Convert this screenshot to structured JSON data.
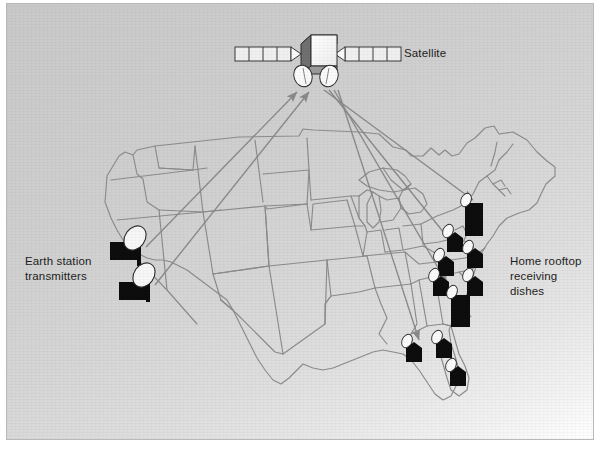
{
  "figure": {
    "background_color": "#d2d2d2",
    "border_color": "#b9b9b9",
    "line_color": "#8c8c8c",
    "building_color": "#0d0d0d",
    "dish_color": "#f4f4f4",
    "arrow_color": "#8a8a8a"
  },
  "labels": {
    "satellite": "Satellite",
    "earth_station": "Earth station\ntransmitters",
    "home_dishes": "Home rooftop\nreceiving dishes"
  },
  "satellite": {
    "name": "satellite",
    "body": {
      "x": 294,
      "y": 33,
      "w": 34,
      "h": 32
    },
    "panel_left": {
      "x": 228,
      "y": 43,
      "w": 56,
      "h": 14,
      "cells": 4
    },
    "panel_right": {
      "x": 338,
      "y": 43,
      "w": 56,
      "h": 14,
      "cells": 4
    },
    "antennas": [
      {
        "cx": 296,
        "cy": 72
      },
      {
        "cx": 322,
        "cy": 72
      }
    ]
  },
  "earth_stations": [
    {
      "id": "earth-station-1",
      "x": 103,
      "y": 238,
      "dish_cx": 128,
      "dish_cy": 236
    },
    {
      "id": "earth-station-2",
      "x": 115,
      "y": 278,
      "dish_cx": 137,
      "dish_cy": 272
    }
  ],
  "home_dishes": [
    {
      "id": "home-dish-1",
      "x": 462,
      "y": 202,
      "tall": true
    },
    {
      "id": "home-dish-2",
      "x": 447,
      "y": 235
    },
    {
      "id": "home-dish-3",
      "x": 466,
      "y": 250
    },
    {
      "id": "home-dish-4",
      "x": 440,
      "y": 262
    },
    {
      "id": "home-dish-5",
      "x": 433,
      "y": 281
    },
    {
      "id": "home-dish-6",
      "x": 466,
      "y": 279
    },
    {
      "id": "home-dish-7",
      "x": 448,
      "y": 293,
      "tall": true
    },
    {
      "id": "home-dish-8",
      "x": 406,
      "y": 345
    },
    {
      "id": "home-dish-9",
      "x": 436,
      "y": 341
    },
    {
      "id": "home-dish-10",
      "x": 450,
      "y": 369
    }
  ],
  "uplinks": [
    {
      "id": "uplink-1",
      "x1": 139,
      "y1": 243,
      "x2": 288,
      "y2": 88
    },
    {
      "id": "uplink-2",
      "x1": 148,
      "y1": 281,
      "x2": 300,
      "y2": 88
    }
  ],
  "downlinks": [
    {
      "id": "downlink-1",
      "x1": 317,
      "y1": 86,
      "x2": 468,
      "y2": 198
    },
    {
      "id": "downlink-2",
      "x1": 322,
      "y1": 86,
      "x2": 452,
      "y2": 247
    },
    {
      "id": "downlink-3",
      "x1": 327,
      "y1": 86,
      "x2": 441,
      "y2": 281
    },
    {
      "id": "downlink-4",
      "x1": 331,
      "y1": 86,
      "x2": 414,
      "y2": 338
    }
  ],
  "counts": {
    "earth_stations": 2,
    "home_dishes": 10,
    "satellite_antennas": 2,
    "uplink_beams": 2,
    "downlink_beams": 4
  }
}
